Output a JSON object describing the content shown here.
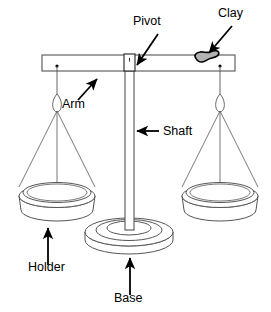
{
  "figure": {
    "background_color": "#ffffff",
    "line_color": "#000000",
    "clay_fill_color": "#b3b3b3",
    "structure_line_color": "#555555"
  },
  "labels": [
    {
      "id": "pivot",
      "text": "Pivot",
      "x": 133,
      "y": 25,
      "anchor": "start"
    },
    {
      "id": "clay",
      "text": "Clay",
      "x": 218,
      "y": 17,
      "anchor": "start"
    },
    {
      "id": "arm",
      "text": "Arm",
      "x": 62,
      "y": 108,
      "anchor": "start"
    },
    {
      "id": "shaft",
      "text": "Shaft",
      "x": 163,
      "y": 135,
      "anchor": "start"
    },
    {
      "id": "holder",
      "text": "Holder",
      "x": 28,
      "y": 271,
      "anchor": "start"
    },
    {
      "id": "base",
      "text": "Base",
      "x": 114,
      "y": 302,
      "anchor": "start"
    }
  ],
  "parts": [
    {
      "id": "arm",
      "name": "Arm",
      "description": "horizontal beam"
    },
    {
      "id": "pivot",
      "name": "Pivot",
      "description": "fulcrum block at beam center"
    },
    {
      "id": "shaft",
      "name": "Shaft",
      "description": "vertical column"
    },
    {
      "id": "base",
      "name": "Base",
      "description": "round disc foot"
    },
    {
      "id": "holder",
      "name": "Holder",
      "description": "hanging pan on strings"
    },
    {
      "id": "clay",
      "name": "Clay",
      "description": "gray lump on right side of beam"
    }
  ],
  "geometry": {
    "arm": {
      "x": 42,
      "y": 55,
      "width": 193,
      "height": 16
    },
    "shaft": {
      "x": 125,
      "y": 55,
      "width": 9,
      "height": 175
    },
    "base": {
      "cx": 129,
      "cy": 232,
      "rx": 44,
      "ry": 14
    },
    "left_pan": {
      "cx": 57,
      "cy": 196,
      "rx": 40,
      "ry": 12
    },
    "right_pan": {
      "cx": 220,
      "cy": 196,
      "rx": 40,
      "ry": 12
    },
    "clay": {
      "cx": 207,
      "cy": 57
    }
  }
}
